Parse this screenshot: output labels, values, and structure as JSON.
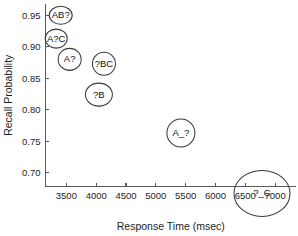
{
  "chart_data": {
    "type": "scatter",
    "title": "",
    "xlabel": "Response Time (msec)",
    "ylabel": "Recall Probability",
    "xlim": [
      3150,
      7350
    ],
    "ylim": [
      0.678,
      0.968
    ],
    "grid": false,
    "legend": null,
    "xticks": [
      3500,
      4000,
      4500,
      5000,
      5500,
      6000,
      6500,
      7000
    ],
    "xtick_labels": [
      "3500",
      "4000",
      "4500",
      "5000",
      "5500",
      "6000",
      "6500",
      "7000"
    ],
    "yticks": [
      0.7,
      0.75,
      0.8,
      0.85,
      0.9,
      0.95
    ],
    "ytick_labels": [
      "0.70",
      "0.75",
      "0.80",
      "0.85",
      "0.90",
      "0.95"
    ],
    "marker_shape": "open-ellipse",
    "points": [
      {
        "label": "AB?",
        "x": 3405,
        "y": 0.95,
        "rx": 11.5,
        "ry": 9.0
      },
      {
        "label": "A?C",
        "x": 3330,
        "y": 0.913,
        "rx": 11.0,
        "ry": 9.5
      },
      {
        "label": "A?",
        "x": 3555,
        "y": 0.88,
        "rx": 11.5,
        "ry": 11.0
      },
      {
        "label": "?BC",
        "x": 4130,
        "y": 0.873,
        "rx": 11.5,
        "ry": 11.5
      },
      {
        "label": "?B",
        "x": 4045,
        "y": 0.824,
        "rx": 13.5,
        "ry": 11.5
      },
      {
        "label": "A_?",
        "x": 5420,
        "y": 0.763,
        "rx": 14.0,
        "ry": 14.0
      },
      {
        "label": "?_C",
        "x": 6780,
        "y": 0.667,
        "rx": 28.0,
        "ry": 23.0
      }
    ]
  }
}
